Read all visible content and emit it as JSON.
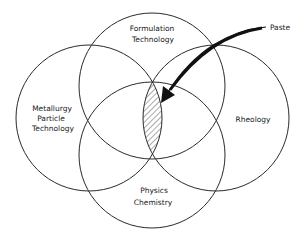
{
  "diagram": {
    "type": "venn",
    "circles": [
      {
        "id": "top",
        "label_lines": [
          "Formulation",
          "Technology"
        ]
      },
      {
        "id": "left",
        "label_lines": [
          "Metallurgy",
          "Particle",
          "Technology"
        ]
      },
      {
        "id": "right",
        "label_lines": [
          "Rheology"
        ]
      },
      {
        "id": "bottom",
        "label_lines": [
          "Physics",
          "Chemistry"
        ]
      }
    ],
    "highlight": {
      "label": "Paste",
      "region": "intersection of all four disciplines",
      "fill": "hatched"
    },
    "colors": {
      "stroke": "#2a2a2a",
      "text": "#1a1a1a",
      "background": "#ffffff"
    }
  }
}
